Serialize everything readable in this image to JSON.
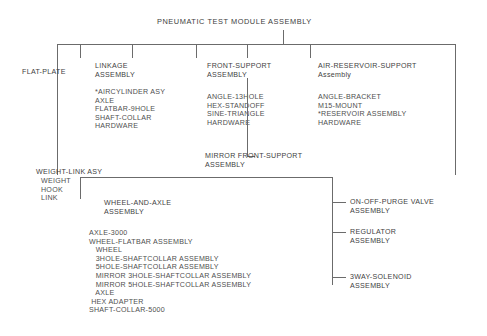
{
  "diagram": {
    "title": "PNEUMATIC TEST MODULE ASSEMBLY",
    "type": "assembly-breakdown-tree"
  },
  "nodes": {
    "flat_plate": {
      "label": "FLAT-PLATE"
    },
    "linkage": {
      "head_line1": "LINKAGE",
      "head_line2": "ASSEMBLY",
      "parts": "*AIRCYLINDER ASY\nAXLE\nFLATBAR-9HOLE\nSHAFT-COLLAR\nHARDWARE"
    },
    "front_support": {
      "head_line1": "FRONT-SUPPORT",
      "head_line2": "ASSEMBLY",
      "parts": "ANGLE-13HOLE\nHEX-STANDOFF\nSINE-TRIANGLE\nHARDWARE"
    },
    "air_reservoir_support": {
      "head_line1": "AIR-RESERVOIR-SUPPORT",
      "head_line2": "Assembly",
      "parts": "ANGLE-BRACKET\nM15-MOUNT\n*RESERVOIR ASSEMBLY\nHARDWARE"
    },
    "mirror_front_support": {
      "head_line1": "MIRROR FRONT-SUPPORT",
      "head_line2": "ASSEMBLY"
    },
    "weight_link": {
      "head": "WEIGHT-LINK ASY",
      "parts": "WEIGHT\nHOOK\nLINK"
    },
    "wheel_and_axle": {
      "head_line1": "WHEEL-AND-AXLE",
      "head_line2": "ASSEMBLY",
      "parts": "AXLE-3000\nWHEEL-FLATBAR ASSEMBLY\n   WHEEL\n   3HOLE-SHAFTCOLLAR ASSEMBLY\n   5HOLE-SHAFTCOLLAR ASSEMBLY\n   MIRROR 3HOLE-SHAFTCOLLAR ASSEMBLY\n   MIRROR 5HOLE-SHAFTCOLLAR ASSEMBLY\n   AXLE\n HEX ADAPTER\nSHAFT-COLLAR-5000"
    },
    "on_off_purge_valve": {
      "head_line1": "ON-OFF-PURGE VALVE",
      "head_line2": "ASSEMBLY"
    },
    "regulator": {
      "head_line1": "REGULATOR",
      "head_line2": "ASSEMBLY"
    },
    "three_way_solenoid": {
      "head_line1": "3WAY-SOLENOID",
      "head_line2": "ASSEMBLY"
    }
  },
  "style": {
    "line_color": "#6b6b6b",
    "text_color": "#4a4a4a",
    "background": "#ffffff"
  }
}
